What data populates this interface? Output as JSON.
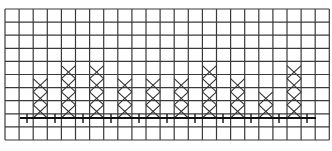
{
  "chart_data": {
    "type": "scatter",
    "subtype": "line-plot (X marks stacked above a number line on grid paper)",
    "title": "",
    "xlabel": "",
    "ylabel": "",
    "tick_labels": [],
    "grid": true,
    "grid_columns": 23,
    "grid_rows": 10,
    "mark_symbol": "X",
    "categories": [
      1,
      2,
      3,
      4,
      5,
      6,
      7,
      8,
      9,
      10
    ],
    "values": [
      3,
      4,
      4,
      3,
      3,
      3,
      4,
      3,
      2,
      4
    ],
    "legend": []
  },
  "colors": {
    "grid": "#3a3a3a",
    "axis": "#111111",
    "mark": "#333333",
    "background": "#ffffff"
  },
  "layout": {
    "left": 5,
    "top": 9,
    "cell_w": 14.1,
    "cell_h": 13.1,
    "axis_y": 118,
    "axis_x_start": 20,
    "axis_x_end": 316,
    "tick_xs": [
      27,
      55,
      83,
      111,
      139,
      167,
      195,
      223,
      251,
      279,
      307
    ],
    "mark_columns": [
      2,
      4,
      6,
      8,
      10,
      12,
      14,
      16,
      18,
      20
    ]
  }
}
